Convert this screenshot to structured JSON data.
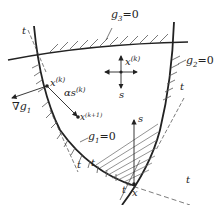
{
  "diagram": {
    "type": "feasible-direction-method",
    "constraints": [
      {
        "id": "g3",
        "label": "g",
        "sub": "3",
        "eq": "=0"
      },
      {
        "id": "g2",
        "label": "g",
        "sub": "2",
        "eq": "=0"
      },
      {
        "id": "g1",
        "label": "g",
        "sub": "1",
        "eq": "=0"
      }
    ],
    "points": {
      "xk": {
        "base": "x",
        "sup": "(k)"
      },
      "xk1": {
        "base": "x",
        "sup": "(k+1)"
      },
      "x_interior": {
        "base": "x",
        "sup": "(k)"
      },
      "x_corner": {
        "base": "x"
      }
    },
    "vectors": {
      "grad_g1": {
        "prefix": "∇",
        "base": "g",
        "sub": "1"
      },
      "step": {
        "base": "αs",
        "sup": "(k)"
      },
      "s_interior": "s",
      "s_corner": "s"
    },
    "tangent_label": "t",
    "colors": {
      "line": "#222222",
      "hatch": "#555555",
      "background": "#ffffff"
    }
  }
}
